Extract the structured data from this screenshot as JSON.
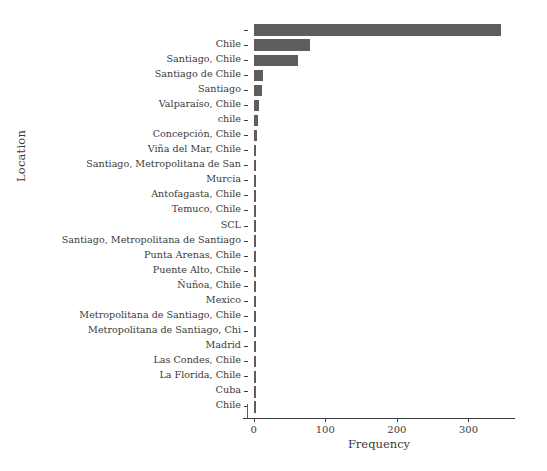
{
  "chart_data": {
    "type": "bar",
    "orientation": "horizontal",
    "title": "",
    "xlabel": "Frequency",
    "ylabel": "Location",
    "xlim": [
      -8,
      358
    ],
    "xticks": [
      0,
      100,
      200,
      300
    ],
    "xticklabels": [
      "0",
      "100",
      "200",
      "300"
    ],
    "grid": false,
    "legend": null,
    "bar_color": "#5d5d5d",
    "categories": [
      "",
      "Chile",
      "Santiago, Chile",
      "Santiago de Chile",
      "Santiago",
      "Valparaíso, Chile",
      "chile",
      "Concepción, Chile",
      "Viña del Mar, Chile",
      "Santiago, Metropolitana de San",
      "Murcia",
      "Antofagasta, Chile",
      "Temuco, Chile",
      "SCL",
      "Santiago, Metropolitana de Santiago",
      "Punta Arenas, Chile",
      "Puente Alto, Chile",
      "Ñuñoa, Chile",
      "Mexico",
      "Metropolitana de Santiago, Chile",
      "Metropolitana de Santiago, Chi",
      "Madrid",
      "Las Condes, Chile",
      "La Florida, Chile",
      "Cuba",
      "Chile "
    ],
    "values": [
      345,
      79,
      62,
      13,
      11,
      8,
      6,
      4,
      3,
      3,
      3,
      3,
      2,
      2,
      2,
      2,
      2,
      2,
      2,
      2,
      2,
      2,
      2,
      2,
      2,
      2
    ]
  },
  "axes": {
    "xlabel": "Frequency",
    "ylabel": "Location"
  }
}
